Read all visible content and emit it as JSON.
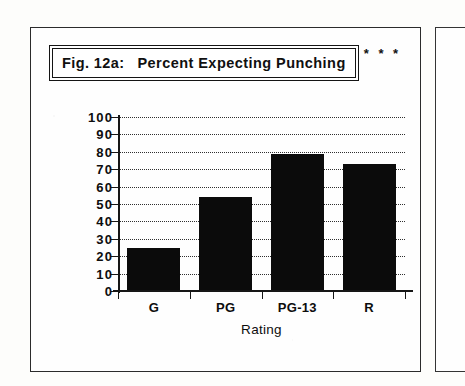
{
  "figure": {
    "label": "Fig. 12a:",
    "title": "Percent Expecting Punching",
    "significance": "* * *"
  },
  "chart_data": {
    "type": "bar",
    "title": "Fig. 12a:  Percent Expecting Punching",
    "categories": [
      "G",
      "PG",
      "PG-13",
      "R"
    ],
    "values": [
      25,
      54,
      79,
      73
    ],
    "xlabel": "Rating",
    "ylabel": "",
    "ylim": [
      0,
      100
    ],
    "ytick_step": 10,
    "yticks": [
      0,
      10,
      20,
      30,
      40,
      50,
      60,
      70,
      80,
      90,
      100
    ],
    "ytick_labels": [
      "0",
      "10",
      "20",
      "30",
      "40",
      "50",
      "60",
      "70",
      "80",
      "90",
      "100"
    ],
    "grid": true,
    "grid_style": "dotted",
    "grid_axis": "y",
    "legend": null,
    "bar_color": "#0b0b0b",
    "annotations": [
      "* * *"
    ]
  },
  "colors": {
    "page_background": "#fdfdfb",
    "frame_border": "#2b2b2b",
    "ink": "#0d0d0d",
    "bar_fill": "#0b0b0b",
    "grid": "#2f2f2f"
  }
}
